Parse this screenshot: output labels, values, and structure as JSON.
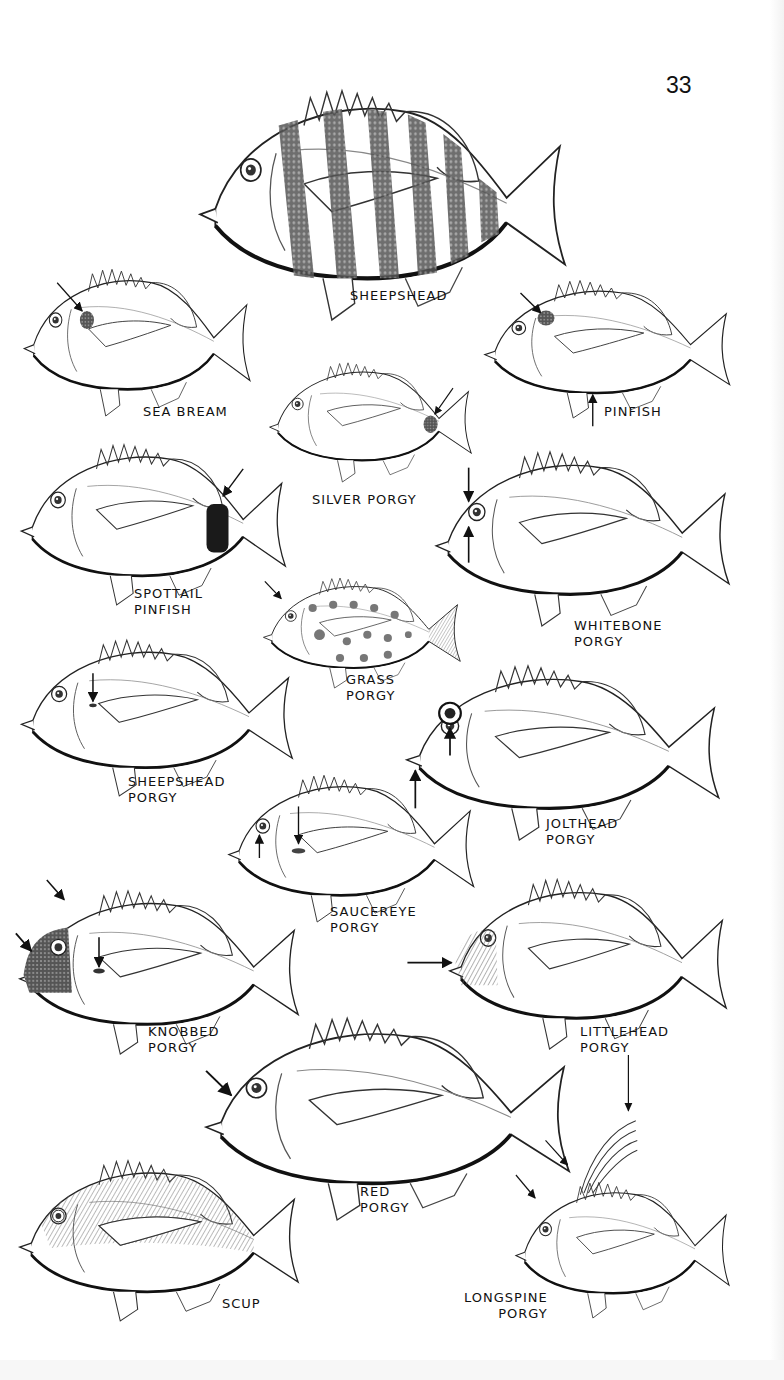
{
  "page": {
    "number": "33",
    "type": "field guide illustration plate"
  },
  "species": [
    {
      "id": "sheepshead",
      "lines": [
        "SHEEPSHEAD"
      ],
      "markers": [],
      "pattern": "vertical-dark-bars"
    },
    {
      "id": "sea-bream",
      "lines": [
        "SEA BREAM"
      ],
      "markers": [
        "shoulder-spot"
      ],
      "pattern": "plain"
    },
    {
      "id": "pinfish",
      "lines": [
        "PINFISH"
      ],
      "markers": [
        "shoulder-spot",
        "belly"
      ],
      "pattern": "plain"
    },
    {
      "id": "silver-porgy",
      "lines": [
        "SILVER PORGY"
      ],
      "markers": [
        "caudal-peduncle-spot"
      ],
      "pattern": "plain"
    },
    {
      "id": "spottail-pinfish",
      "lines": [
        "SPOTTAIL",
        "PINFISH"
      ],
      "markers": [
        "black-saddle-on-tail"
      ],
      "pattern": "plain"
    },
    {
      "id": "whitebone-porgy",
      "lines": [
        "WHITEBONE",
        "PORGY"
      ],
      "markers": [
        "above-eye",
        "below-eye"
      ],
      "pattern": "plain"
    },
    {
      "id": "grass-porgy",
      "lines": [
        "GRASS",
        "PORGY"
      ],
      "markers": [
        "head"
      ],
      "pattern": "spotted"
    },
    {
      "id": "sheepshead-porgy",
      "lines": [
        "SHEEPSHEAD",
        "PORGY"
      ],
      "markers": [
        "pectoral-spot"
      ],
      "pattern": "plain"
    },
    {
      "id": "jolthead-porgy",
      "lines": [
        "JOLTHEAD",
        "PORGY"
      ],
      "markers": [
        "eye",
        "mouth"
      ],
      "pattern": "plain"
    },
    {
      "id": "saucereye-porgy",
      "lines": [
        "SAUCEREYE",
        "PORGY"
      ],
      "markers": [
        "below-eye",
        "pectoral-spot"
      ],
      "pattern": "plain"
    },
    {
      "id": "knobbed-porgy",
      "lines": [
        "KNOBBED",
        "PORGY"
      ],
      "markers": [
        "nape",
        "dark-face",
        "pectoral-spot"
      ],
      "pattern": "plain"
    },
    {
      "id": "littlehead-porgy",
      "lines": [
        "LITTLEHEAD",
        "PORGY"
      ],
      "markers": [
        "cheek-lines"
      ],
      "pattern": "plain"
    },
    {
      "id": "red-porgy",
      "lines": [
        "RED",
        "PORGY"
      ],
      "markers": [
        "forehead"
      ],
      "pattern": "plain"
    },
    {
      "id": "scup",
      "lines": [
        "SCUP"
      ],
      "markers": [],
      "pattern": "shaded"
    },
    {
      "id": "longspine-porgy",
      "lines": [
        "LONGSPINE",
        "PORGY"
      ],
      "markers": [
        "long-dorsal-spines",
        "nape",
        "forehead"
      ],
      "pattern": "plain"
    }
  ]
}
